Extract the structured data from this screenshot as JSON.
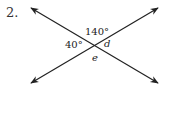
{
  "problem_number": "2.",
  "labels": {
    "top_angle": "140°",
    "left_angle": "40°",
    "right_angle": "d",
    "bottom_angle": "e"
  },
  "diagram": {
    "type": "intersecting-lines",
    "line_color": "#222222"
  }
}
